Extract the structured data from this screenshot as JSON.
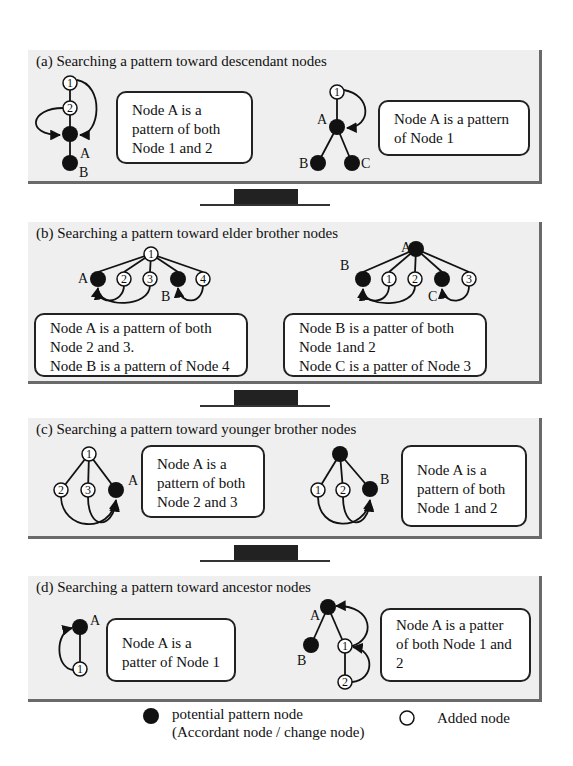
{
  "panels": [
    {
      "id": "a",
      "title": "(a) Searching a pattern toward descendant nodes",
      "boxes": [
        {
          "lines": [
            "Node A is a",
            "pattern of both",
            "Node 1 and 2"
          ]
        },
        {
          "lines": [
            "Node A is a pattern",
            "of Node 1"
          ]
        }
      ]
    },
    {
      "id": "b",
      "title": "(b) Searching a pattern toward elder brother nodes",
      "boxes": [
        {
          "lines": [
            "Node A is a pattern of both",
            "Node 2 and 3.",
            "Node B is a pattern of Node 4"
          ]
        },
        {
          "lines": [
            "Node B is a patter of both",
            "Node 1and 2",
            "Node C is a patter of Node 3"
          ]
        }
      ]
    },
    {
      "id": "c",
      "title": "(c) Searching a pattern toward younger brother nodes",
      "boxes": [
        {
          "lines": [
            "Node A is a",
            "pattern of both",
            "Node 2 and 3"
          ]
        },
        {
          "lines": [
            "Node A is a",
            "pattern of  both",
            "Node 1 and 2"
          ]
        }
      ]
    },
    {
      "id": "d",
      "title": "(d) Searching a pattern toward ancestor nodes",
      "boxes": [
        {
          "lines": [
            "Node A is a",
            "patter of Node 1"
          ]
        },
        {
          "lines": [
            "Node A is a patter",
            "of both Node 1 and",
            "2"
          ]
        }
      ]
    }
  ],
  "node_labels": {
    "one": "1",
    "two": "2",
    "three": "3",
    "four": "4",
    "A": "A",
    "B": "B",
    "C": "C"
  },
  "legend": {
    "filled_label_1": "potential  pattern node",
    "filled_label_2": "(Accordant node / change node)",
    "open_label": "Added node"
  },
  "colors": {
    "panel_bg": "#efefef",
    "node_fill": "#111111",
    "panel_shadow": "#6a6a6a"
  }
}
